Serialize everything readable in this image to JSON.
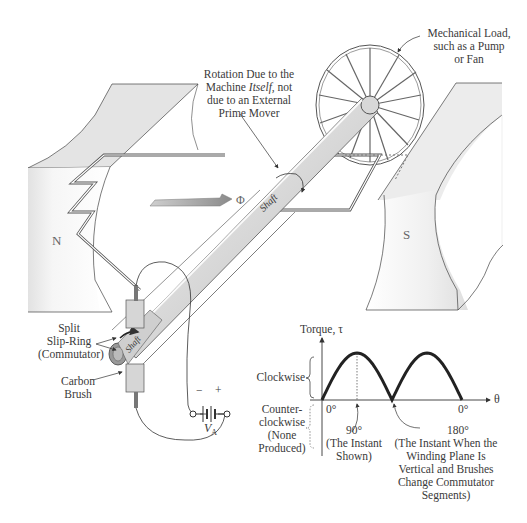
{
  "diagram": {
    "labels": {
      "mechanical_load": [
        "Mechanical Load,",
        "such as a Pump",
        "or Fan"
      ],
      "rotation": {
        "line1": "Rotation Due to the",
        "line2_a": "Machine ",
        "line2_italic": "Itself,",
        "line2_b": " not",
        "line3": "due to an External",
        "line4": "Prime Mover"
      },
      "flux": "Φ",
      "pole_north": "N",
      "pole_south": "S",
      "shaft_upper": "Shaft",
      "shaft_lower": "Shaft",
      "split_slip_ring": [
        "Split",
        "Slip-Ring",
        "(Commutator)"
      ],
      "carbon_brush": [
        "Carbon",
        "Brush"
      ],
      "battery_minus": "−",
      "battery_plus": "+",
      "battery_label": "V",
      "battery_sub": "A"
    },
    "colors": {
      "line": "#333333",
      "pole_fill": "#e6e6e6",
      "shaft_fill": "#dcdcdc",
      "flux_arrow": "#9a9a9a",
      "torque_curve": "#222222"
    }
  },
  "chart_data": {
    "type": "line",
    "title": "",
    "ylabel": "Torque, τ",
    "xlabel": "θ",
    "x": [
      0,
      30,
      60,
      90,
      120,
      150,
      180,
      210,
      240,
      270,
      300,
      330,
      360
    ],
    "series": [
      {
        "name": "Torque (rectified by commutator)",
        "values": [
          0,
          0.5,
          0.87,
          1.0,
          0.87,
          0.5,
          0,
          0.5,
          0.87,
          1.0,
          0.87,
          0.5,
          0
        ]
      }
    ],
    "x_tick_labels": [
      "0°",
      "0°"
    ],
    "y_region_labels": {
      "positive": "Clockwise",
      "negative": [
        "Counter-",
        "clockwise",
        "(None",
        "Produced)"
      ]
    },
    "annotations": [
      {
        "x": 90,
        "text": [
          "90°",
          "(The Instant",
          "Shown)"
        ]
      },
      {
        "x": 180,
        "text": [
          "180°",
          "(The Instant When the",
          "Winding Plane Is",
          "Vertical and Brushes",
          "Change Commutator",
          "Segments)"
        ]
      }
    ],
    "grid": false,
    "legend": "none"
  }
}
